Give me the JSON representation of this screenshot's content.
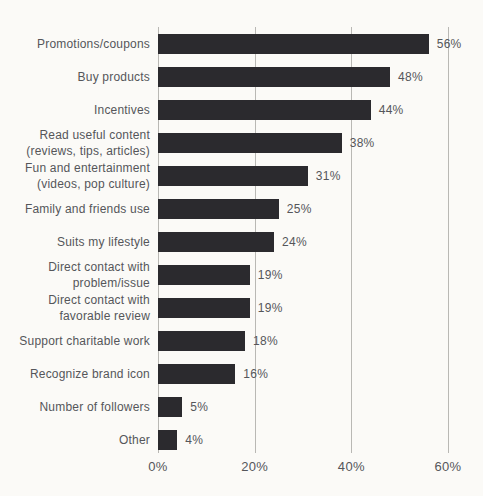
{
  "colors": {
    "background": "#fbfaf7",
    "bar": "#2b2a2e",
    "text": "#55565a",
    "gridline": "#b9b8b4"
  },
  "chart_data": {
    "type": "bar",
    "orientation": "horizontal",
    "title": "",
    "xlabel": "",
    "ylabel": "",
    "xlim": [
      0,
      60
    ],
    "grid": "vertical-lines-on",
    "legend": "none",
    "categories": [
      "Promotions/coupons",
      "Buy products",
      "Incentives",
      "Read useful content\n(reviews, tips, articles)",
      "Fun and entertainment\n(videos, pop culture)",
      "Family and friends use",
      "Suits my lifestyle",
      "Direct contact with\nproblem/issue",
      "Direct contact with\nfavorable review",
      "Support charitable work",
      "Recognize brand icon",
      "Number of followers",
      "Other"
    ],
    "values": [
      56,
      48,
      44,
      38,
      31,
      25,
      24,
      19,
      19,
      18,
      16,
      5,
      4
    ],
    "value_labels": [
      "56%",
      "48%",
      "44%",
      "38%",
      "31%",
      "25%",
      "24%",
      "19%",
      "19%",
      "18%",
      "16%",
      "5%",
      "4%"
    ],
    "x_ticks": [
      {
        "value": 0,
        "label": "0%"
      },
      {
        "value": 20,
        "label": "20%"
      },
      {
        "value": 40,
        "label": "40%"
      },
      {
        "value": 60,
        "label": "60%"
      }
    ]
  }
}
